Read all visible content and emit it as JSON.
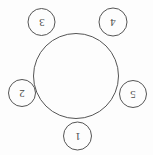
{
  "figure": {
    "width": 153,
    "height": 155,
    "background_color": "#fdfdfd",
    "stroke_color": "#555555",
    "text_color": "#4a4a4a",
    "stroke_width": 1,
    "label_rotation_degrees": 180
  },
  "main_circle": {
    "name": "central-circle",
    "cx": 76,
    "cy": 76,
    "r": 42.5
  },
  "nodes": [
    {
      "label": "1",
      "cx": 77.5,
      "cy": 136,
      "r": 14,
      "position": "bottom"
    },
    {
      "label": "2",
      "cx": 22,
      "cy": 93,
      "r": 13.5,
      "position": "left"
    },
    {
      "label": "3",
      "cx": 41.5,
      "cy": 22,
      "r": 13.5,
      "position": "top-left"
    },
    {
      "label": "4",
      "cx": 113,
      "cy": 22,
      "r": 14,
      "position": "top-right"
    },
    {
      "label": "5",
      "cx": 133,
      "cy": 94,
      "r": 13.5,
      "position": "right"
    }
  ]
}
